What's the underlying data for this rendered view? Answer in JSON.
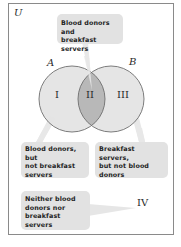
{
  "diagram": {
    "type": "venn",
    "universe_label": "U",
    "sets": [
      {
        "name": "A",
        "description": "Blood donors"
      },
      {
        "name": "B",
        "description": "Breakfast servers"
      }
    ],
    "regions": [
      {
        "id": "I",
        "label": "I",
        "callout": "Blood donors, but not breakfast servers"
      },
      {
        "id": "II",
        "label": "II",
        "callout": "Blood donors and breakfast servers"
      },
      {
        "id": "III",
        "label": "III",
        "callout": "Breakfast servers, but not blood donors"
      },
      {
        "id": "IV",
        "label": "IV",
        "callout": "Neither blood donors nor breakfast servers"
      }
    ],
    "colors": {
      "circle_fill": "#e4e4e4",
      "intersection_fill": "#b8b8b8",
      "circle_stroke": "#6e6e6e",
      "callout_fill": "#e2e2e2",
      "frame_stroke": "#8a8a8a"
    }
  },
  "callouts": {
    "top": [
      "Blood donors and",
      "breakfast servers"
    ],
    "left": [
      "Blood donors, but",
      "not breakfast",
      "servers"
    ],
    "right": [
      "Breakfast servers,",
      "but not blood",
      "donors"
    ],
    "bottom": [
      "Neither blood",
      "donors nor",
      "breakfast servers"
    ]
  }
}
